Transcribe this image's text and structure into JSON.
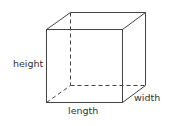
{
  "diagram": {
    "type": "rectangular-prism",
    "labels": {
      "height": "height",
      "length": "length",
      "width": "width"
    },
    "colors": {
      "line": "#444444",
      "text": "#333333",
      "background": "#ffffff"
    }
  }
}
